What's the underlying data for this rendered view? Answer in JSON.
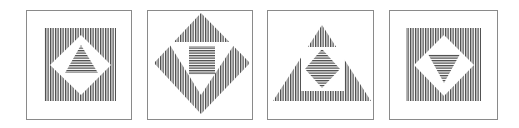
{
  "figure": {
    "width": 519,
    "height": 128,
    "background": "#ffffff",
    "frame_color": "#8a8a8a",
    "stripe_color": "#4a4a4a",
    "stripe_period": 2.5,
    "panels": [
      {
        "name": "panel-1",
        "frame": {
          "x": 26,
          "y": 10,
          "w": 105,
          "h": 109
        },
        "layers": [
          {
            "shape": "square",
            "fill": "vertical-stripes",
            "points": "44,28 116,28 116,101 44,101"
          },
          {
            "shape": "diamond",
            "fill": "white",
            "points": "81,35 111,65 81,95 50,65"
          },
          {
            "shape": "triangle-up",
            "fill": "horizontal-stripes",
            "points": "81,45 98,73 65,73"
          }
        ]
      },
      {
        "name": "panel-2",
        "frame": {
          "x": 147,
          "y": 10,
          "w": 105,
          "h": 109
        },
        "layers": [
          {
            "shape": "diamond",
            "fill": "vertical-stripes",
            "points": "201,13 250,63 201,114 154,63"
          },
          {
            "shape": "triangle-down",
            "fill": "white",
            "points": "168,42 236,42 201,95"
          },
          {
            "shape": "square",
            "fill": "horizontal-stripes",
            "points": "189,46 215,46 215,75 189,75"
          }
        ]
      },
      {
        "name": "panel-3",
        "frame": {
          "x": 267,
          "y": 10,
          "w": 106,
          "h": 109
        },
        "layers": [
          {
            "shape": "triangle-up",
            "fill": "vertical-stripes",
            "points": "322,25 371,101 273,101"
          },
          {
            "shape": "square",
            "fill": "white",
            "points": "301,47 344,47 344,91 301,91"
          },
          {
            "shape": "diamond",
            "fill": "horizontal-stripes",
            "points": "322,49 340,69 322,88 305,69"
          }
        ]
      },
      {
        "name": "panel-4",
        "frame": {
          "x": 389,
          "y": 10,
          "w": 108,
          "h": 109
        },
        "layers": [
          {
            "shape": "square",
            "fill": "vertical-stripes",
            "points": "406,28 481,28 481,101 406,101"
          },
          {
            "shape": "diamond",
            "fill": "white",
            "points": "444,35 474,65 444,96 414,65"
          },
          {
            "shape": "triangle-down",
            "fill": "horizontal-stripes",
            "points": "428,54 460,54 444,83"
          }
        ]
      }
    ]
  }
}
